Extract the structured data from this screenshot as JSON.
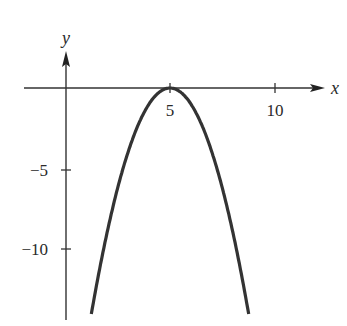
{
  "chart_data": {
    "type": "line",
    "title": "",
    "function": "y = -(x - 5)^2",
    "xlabel": "x",
    "ylabel": "y",
    "xlim": [
      -2,
      12.5
    ],
    "ylim": [
      -14,
      3
    ],
    "grid": false,
    "legend": null,
    "x_ticks": [
      5,
      10
    ],
    "x_tick_labels": [
      "5",
      "10"
    ],
    "y_ticks": [
      -5,
      -10
    ],
    "y_tick_labels": [
      "−5",
      "−10"
    ],
    "series": [
      {
        "name": "parabola",
        "color": "#333333",
        "x": [
          1.1,
          1.5,
          2,
          2.5,
          3,
          3.5,
          4,
          4.5,
          5,
          5.5,
          6,
          6.5,
          7,
          7.5,
          8,
          8.5,
          8.9
        ],
        "values": [
          -15.21,
          -12.25,
          -9,
          -6.25,
          -4,
          -2.25,
          -1,
          -0.25,
          0,
          -0.25,
          -1,
          -2.25,
          -4,
          -6.25,
          -9,
          -12.25,
          -15.21
        ]
      }
    ],
    "annotations": [
      {
        "text": "vertex",
        "x": 5,
        "y": 0
      }
    ]
  },
  "axes": {
    "x_label": "x",
    "y_label": "y",
    "x_tick_5": "5",
    "x_tick_10": "10",
    "y_tick_neg5": "−5",
    "y_tick_neg10": "−10"
  },
  "colors": {
    "axis": "#333333",
    "curve": "#333333",
    "background": "#ffffff"
  }
}
